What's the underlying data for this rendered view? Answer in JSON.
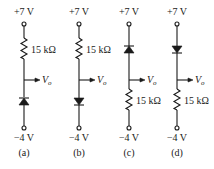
{
  "figure": {
    "circuits": [
      {
        "id": "a",
        "caption": "(a)",
        "top_voltage": "+7 V",
        "bottom_voltage": "−4 V",
        "output_label": "V",
        "output_sub": "o",
        "resistor_label": "15 kΩ",
        "order": "resistor-top-diode-bottom",
        "diode_direction": "anode-bottom (points up)"
      },
      {
        "id": "b",
        "caption": "(b)",
        "top_voltage": "+7 V",
        "bottom_voltage": "−4 V",
        "output_label": "V",
        "output_sub": "o",
        "resistor_label": "15 kΩ",
        "order": "resistor-top-diode-bottom",
        "diode_direction": "anode-top (points down)"
      },
      {
        "id": "c",
        "caption": "(c)",
        "top_voltage": "+7 V",
        "bottom_voltage": "−4 V",
        "output_label": "V",
        "output_sub": "o",
        "resistor_label": "15 kΩ",
        "order": "diode-top-resistor-bottom",
        "diode_direction": "anode-bottom (points up)"
      },
      {
        "id": "d",
        "caption": "(d)",
        "top_voltage": "+7 V",
        "bottom_voltage": "−4 V",
        "output_label": "V",
        "output_sub": "o",
        "resistor_label": "15 kΩ",
        "order": "diode-top-resistor-bottom",
        "diode_direction": "anode-top (points down)"
      }
    ]
  }
}
